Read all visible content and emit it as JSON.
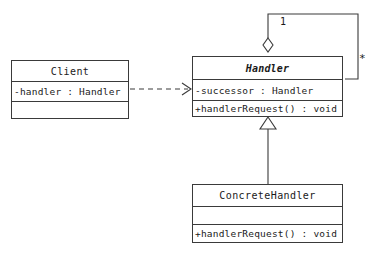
{
  "diagram": {
    "notation": "UML class diagram",
    "background_color": "#ffffff",
    "line_color": "#3a3a3a",
    "text_color": "#1a1a1a"
  },
  "classes": {
    "client": {
      "name": "Client",
      "is_abstract": false,
      "attributes": [
        "-handler : Handler"
      ],
      "operations": []
    },
    "handler": {
      "name": "Handler",
      "is_abstract": true,
      "attributes": [
        "-successor : Handler"
      ],
      "operations": [
        "+handlerRequest() : void"
      ]
    },
    "concrete_handler": {
      "name": "ConcreteHandler",
      "is_abstract": false,
      "attributes": [],
      "operations": [
        "+handlerRequest() : void"
      ]
    }
  },
  "relationships": {
    "client_to_handler": {
      "kind": "dependency",
      "line_style": "dashed",
      "arrowhead": "open",
      "source": "Client",
      "target": "Handler",
      "label": ""
    },
    "handler_self_association": {
      "kind": "aggregation",
      "line_style": "solid",
      "arrowhead": "hollow-diamond",
      "source": "Handler",
      "target": "Handler",
      "source_multiplicity": "1",
      "target_multiplicity": "*"
    },
    "concrete_to_handler": {
      "kind": "generalization",
      "line_style": "solid",
      "arrowhead": "hollow-triangle",
      "source": "ConcreteHandler",
      "target": "Handler",
      "label": ""
    }
  },
  "labels": {
    "multiplicity_one": "1",
    "multiplicity_many": "*"
  }
}
